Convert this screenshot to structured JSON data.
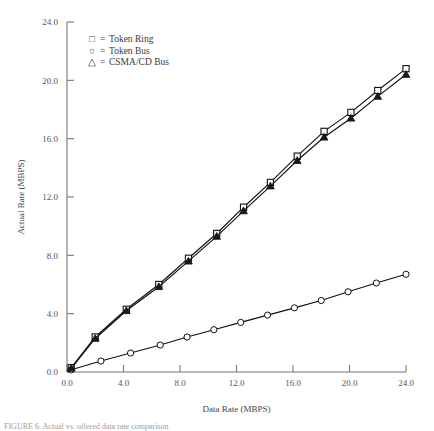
{
  "chart_data": {
    "type": "line",
    "title": "",
    "xlabel": "Data Rate (MBPS)",
    "ylabel": "Actual Rate (MBPS)",
    "xlim": [
      0,
      24
    ],
    "ylim": [
      0,
      24
    ],
    "xticks": [
      "0.0",
      "4.0",
      "8.0",
      "12.0",
      "16.0",
      "20.0",
      "24.0"
    ],
    "yticks": [
      "0.0",
      "4.0",
      "8.0",
      "12.0",
      "16.0",
      "20.0",
      "24.0"
    ],
    "xtick_values": [
      0,
      4,
      8,
      12,
      16,
      20,
      24
    ],
    "ytick_values": [
      0,
      4,
      8,
      12,
      16,
      20,
      24
    ],
    "grid": false,
    "legend_position": "top-left-inside",
    "series": [
      {
        "name": "Token Ring",
        "marker": "square",
        "legend_glyph": "□",
        "color": "#111111",
        "x": [
          0.3,
          2.0,
          4.2,
          6.5,
          8.6,
          10.6,
          12.5,
          14.4,
          16.3,
          18.2,
          20.1,
          22.0,
          24.0
        ],
        "y": [
          0.3,
          2.4,
          4.3,
          6.0,
          7.8,
          9.5,
          11.3,
          13.0,
          14.8,
          16.5,
          17.8,
          19.3,
          20.8
        ]
      },
      {
        "name": "Token Bus",
        "marker": "circle",
        "legend_glyph": "○",
        "color": "#111111",
        "x": [
          0.3,
          2.4,
          4.5,
          6.6,
          8.5,
          10.4,
          12.3,
          14.2,
          16.1,
          18.0,
          19.9,
          21.9,
          24.0
        ],
        "y": [
          0.15,
          0.75,
          1.3,
          1.85,
          2.4,
          2.9,
          3.4,
          3.9,
          4.4,
          4.9,
          5.5,
          6.1,
          6.7
        ]
      },
      {
        "name": "CSMA/CD Bus",
        "marker": "triangle",
        "legend_glyph": "△",
        "color": "#111111",
        "x": [
          0.3,
          2.0,
          4.2,
          6.5,
          8.6,
          10.6,
          12.5,
          14.4,
          16.3,
          18.2,
          20.1,
          22.0,
          24.0
        ],
        "y": [
          0.25,
          2.3,
          4.2,
          5.85,
          7.6,
          9.3,
          11.05,
          12.75,
          14.5,
          16.1,
          17.4,
          18.9,
          20.4
        ]
      }
    ],
    "legend": [
      {
        "glyph": "□",
        "equals": "=",
        "label": "Token Ring"
      },
      {
        "glyph": "○",
        "equals": "=",
        "label": "Token Bus"
      },
      {
        "glyph": "△",
        "equals": "=",
        "label": "CSMA/CD Bus"
      }
    ]
  },
  "figure": {
    "caption": "FIGURE 6. Actual vs. offered data rate comparison"
  }
}
